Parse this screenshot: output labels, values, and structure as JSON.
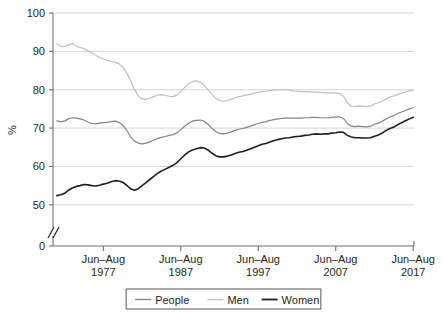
{
  "chart_data": {
    "type": "line",
    "title": "",
    "subtitle": "",
    "xlabel": "",
    "ylabel": "%",
    "ylim": [
      45,
      100
    ],
    "y_ticks": [
      "100",
      "90",
      "80",
      "70",
      "60",
      "50",
      "0"
    ],
    "y_tick_values": [
      100,
      90,
      80,
      70,
      60,
      50,
      0
    ],
    "grid": true,
    "axis_break": true,
    "legend_position": "bottom",
    "x_tick_labels": [
      {
        "period": "Jun–Aug",
        "year": "1977"
      },
      {
        "period": "Jun–Aug",
        "year": "1987"
      },
      {
        "period": "Jun–Aug",
        "year": "1997"
      },
      {
        "period": "Jun–Aug",
        "year": "2007"
      },
      {
        "period": "Jun–Aug",
        "year": "2017"
      }
    ],
    "x_tick_years": [
      1977,
      1987,
      1997,
      2007,
      2017
    ],
    "x_range": [
      1971,
      2017.6
    ],
    "series": [
      {
        "name": "People",
        "color": "#808285",
        "width": 1.2,
        "x": [
          1971.5,
          1972,
          1972.5,
          1973,
          1973.5,
          1974,
          1974.5,
          1975,
          1975.5,
          1976,
          1976.5,
          1977,
          1977.5,
          1978,
          1978.5,
          1979,
          1979.5,
          1980,
          1980.5,
          1981,
          1981.5,
          1982,
          1982.5,
          1983,
          1983.5,
          1984,
          1984.5,
          1985,
          1985.5,
          1986,
          1986.5,
          1987,
          1987.5,
          1988,
          1988.5,
          1989,
          1989.5,
          1990,
          1990.5,
          1991,
          1991.5,
          1992,
          1992.5,
          1993,
          1993.5,
          1994,
          1994.5,
          1995,
          1995.5,
          1996,
          1996.5,
          1997,
          1997.5,
          1998,
          1998.5,
          1999,
          1999.5,
          2000,
          2000.5,
          2001,
          2001.5,
          2002,
          2002.5,
          2003,
          2003.5,
          2004,
          2004.5,
          2005,
          2005.5,
          2006,
          2006.5,
          2007,
          2007.5,
          2008,
          2008.5,
          2009,
          2009.5,
          2010,
          2010.5,
          2011,
          2011.5,
          2012,
          2012.5,
          2013,
          2013.5,
          2014,
          2014.5,
          2015,
          2015.5,
          2016,
          2016.5,
          2017,
          2017.5
        ],
        "y": [
          71.9,
          71.7,
          71.8,
          72.4,
          72.7,
          72.6,
          72.4,
          72.1,
          71.6,
          71.2,
          71.1,
          71.3,
          71.4,
          71.5,
          71.7,
          71.8,
          71.5,
          70.8,
          69.5,
          67.8,
          66.6,
          66.1,
          65.9,
          66.1,
          66.4,
          66.9,
          67.3,
          67.6,
          67.8,
          68.1,
          68.3,
          68.8,
          69.6,
          70.5,
          71.3,
          71.8,
          72.0,
          72.1,
          71.8,
          71.0,
          70.0,
          69.1,
          68.6,
          68.5,
          68.7,
          69.0,
          69.4,
          69.7,
          69.9,
          70.2,
          70.5,
          70.9,
          71.2,
          71.5,
          71.7,
          72.0,
          72.2,
          72.4,
          72.5,
          72.6,
          72.6,
          72.6,
          72.6,
          72.6,
          72.7,
          72.7,
          72.8,
          72.8,
          72.7,
          72.7,
          72.7,
          72.8,
          72.9,
          72.9,
          72.5,
          71.2,
          70.5,
          70.4,
          70.5,
          70.4,
          70.3,
          70.5,
          71.0,
          71.3,
          71.8,
          72.4,
          72.9,
          73.3,
          73.8,
          74.2,
          74.6,
          75.0,
          75.3
        ]
      },
      {
        "name": "Men",
        "color": "#bcbec0",
        "width": 1.2,
        "x": [
          1971.5,
          1972,
          1972.5,
          1973,
          1973.5,
          1974,
          1974.5,
          1975,
          1975.5,
          1976,
          1976.5,
          1977,
          1977.5,
          1978,
          1978.5,
          1979,
          1979.5,
          1980,
          1980.5,
          1981,
          1981.5,
          1982,
          1982.5,
          1983,
          1983.5,
          1984,
          1984.5,
          1985,
          1985.5,
          1986,
          1986.5,
          1987,
          1987.5,
          1988,
          1988.5,
          1989,
          1989.5,
          1990,
          1990.5,
          1991,
          1991.5,
          1992,
          1992.5,
          1993,
          1993.5,
          1994,
          1994.5,
          1995,
          1995.5,
          1996,
          1996.5,
          1997,
          1997.5,
          1998,
          1998.5,
          1999,
          1999.5,
          2000,
          2000.5,
          2001,
          2001.5,
          2002,
          2002.5,
          2003,
          2003.5,
          2004,
          2004.5,
          2005,
          2005.5,
          2006,
          2006.5,
          2007,
          2007.5,
          2008,
          2008.5,
          2009,
          2009.5,
          2010,
          2010.5,
          2011,
          2011.5,
          2012,
          2012.5,
          2013,
          2013.5,
          2014,
          2014.5,
          2015,
          2015.5,
          2016,
          2016.5,
          2017,
          2017.5
        ],
        "y": [
          92.0,
          91.3,
          91.2,
          91.7,
          92.1,
          91.4,
          91.0,
          90.7,
          90.2,
          89.6,
          89.0,
          88.4,
          88.0,
          87.7,
          87.4,
          87.2,
          86.8,
          85.9,
          84.4,
          82.5,
          80.2,
          78.4,
          77.6,
          77.5,
          77.8,
          78.2,
          78.6,
          78.7,
          78.5,
          78.3,
          78.2,
          78.6,
          79.5,
          80.6,
          81.6,
          82.1,
          82.3,
          82.0,
          81.2,
          80.0,
          78.8,
          77.8,
          77.2,
          77.0,
          77.2,
          77.5,
          77.9,
          78.2,
          78.4,
          78.6,
          78.8,
          79.1,
          79.3,
          79.5,
          79.6,
          79.8,
          79.9,
          80.0,
          80.0,
          80.0,
          79.9,
          79.7,
          79.6,
          79.5,
          79.5,
          79.5,
          79.4,
          79.4,
          79.3,
          79.2,
          79.2,
          79.2,
          79.2,
          79.0,
          78.3,
          76.6,
          75.7,
          75.6,
          75.8,
          75.7,
          75.6,
          75.8,
          76.3,
          76.6,
          77.0,
          77.6,
          78.1,
          78.4,
          78.8,
          79.1,
          79.4,
          79.7,
          79.9
        ]
      },
      {
        "name": "Women",
        "color": "#231f20",
        "width": 1.6,
        "x": [
          1971.5,
          1972,
          1972.5,
          1973,
          1973.5,
          1974,
          1974.5,
          1975,
          1975.5,
          1976,
          1976.5,
          1977,
          1977.5,
          1978,
          1978.5,
          1979,
          1979.5,
          1980,
          1980.5,
          1981,
          1981.5,
          1982,
          1982.5,
          1983,
          1983.5,
          1984,
          1984.5,
          1985,
          1985.5,
          1986,
          1986.5,
          1987,
          1987.5,
          1988,
          1988.5,
          1989,
          1989.5,
          1990,
          1990.5,
          1991,
          1991.5,
          1992,
          1992.5,
          1993,
          1993.5,
          1994,
          1994.5,
          1995,
          1995.5,
          1996,
          1996.5,
          1997,
          1997.5,
          1998,
          1998.5,
          1999,
          1999.5,
          2000,
          2000.5,
          2001,
          2001.5,
          2002,
          2002.5,
          2003,
          2003.5,
          2004,
          2004.5,
          2005,
          2005.5,
          2006,
          2006.5,
          2007,
          2007.5,
          2008,
          2008.5,
          2009,
          2009.5,
          2010,
          2010.5,
          2011,
          2011.5,
          2012,
          2012.5,
          2013,
          2013.5,
          2014,
          2014.5,
          2015,
          2015.5,
          2016,
          2016.5,
          2017,
          2017.5
        ],
        "y": [
          52.4,
          52.6,
          53.0,
          53.8,
          54.4,
          54.8,
          55.0,
          55.3,
          55.2,
          55.0,
          54.9,
          55.1,
          55.4,
          55.6,
          56.0,
          56.3,
          56.2,
          55.9,
          55.1,
          54.2,
          53.8,
          54.2,
          55.0,
          55.8,
          56.6,
          57.4,
          58.2,
          58.8,
          59.3,
          59.8,
          60.3,
          61.0,
          62.0,
          63.0,
          63.8,
          64.3,
          64.6,
          64.9,
          64.8,
          64.3,
          63.5,
          62.8,
          62.5,
          62.5,
          62.7,
          63.0,
          63.4,
          63.7,
          63.9,
          64.2,
          64.6,
          65.0,
          65.4,
          65.8,
          66.0,
          66.4,
          66.7,
          67.0,
          67.2,
          67.4,
          67.5,
          67.7,
          67.8,
          67.9,
          68.1,
          68.2,
          68.4,
          68.5,
          68.4,
          68.5,
          68.5,
          68.7,
          68.8,
          69.0,
          68.9,
          68.1,
          67.7,
          67.5,
          67.5,
          67.4,
          67.4,
          67.5,
          67.9,
          68.2,
          68.7,
          69.4,
          69.9,
          70.3,
          70.9,
          71.4,
          71.9,
          72.4,
          72.8
        ]
      }
    ],
    "legend": [
      {
        "label": "People",
        "color": "#808285"
      },
      {
        "label": "Men",
        "color": "#bcbec0"
      },
      {
        "label": "Women",
        "color": "#231f20"
      }
    ]
  },
  "layout": {
    "plot_left": 53,
    "plot_right": 414,
    "plot_top": 13,
    "plot_bottom": 246
  }
}
